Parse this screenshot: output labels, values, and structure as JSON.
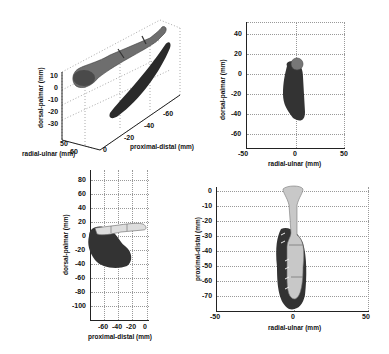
{
  "figure": {
    "panels": [
      {
        "id": "3d-view",
        "type": "3d",
        "zlabel": "dorsal-palmar (mm)",
        "zticks": [
          "10",
          "0",
          "-10",
          "-20",
          "-30"
        ],
        "xlabel": "proximal-distal (mm)",
        "xticks": [
          "0",
          "-20",
          "-40",
          "-60"
        ],
        "ylabel": "radial-ulnar (mm)",
        "yticks": [
          "50",
          "60"
        ]
      },
      {
        "id": "top-right-view",
        "type": "2d",
        "ylabel": "dorsal-palmar (mm)",
        "yticks": [
          "40",
          "20",
          "0",
          "-20",
          "-40",
          "-60"
        ],
        "xlabel": "radial-ulnar (mm)",
        "xticks": [
          "-50",
          "0",
          "50"
        ]
      },
      {
        "id": "bottom-left-view",
        "type": "2d",
        "ylabel": "dorsal-palmar (mm)",
        "yticks": [
          "80",
          "60",
          "40",
          "20",
          "0",
          "-20",
          "-40",
          "-60",
          "-80",
          "-100"
        ],
        "xlabel": "proximal-distal (mm)",
        "xticks": [
          "-60",
          "-40",
          "-20",
          "0"
        ]
      },
      {
        "id": "bottom-right-view",
        "type": "2d",
        "ylabel": "proximal-distal (mm)",
        "yticks": [
          "0",
          "-10",
          "-20",
          "-30",
          "-40",
          "-50",
          "-60",
          "-70"
        ],
        "xlabel": "radial-ulnar (mm)",
        "xticks": [
          "-50",
          "0",
          "50"
        ]
      }
    ]
  }
}
